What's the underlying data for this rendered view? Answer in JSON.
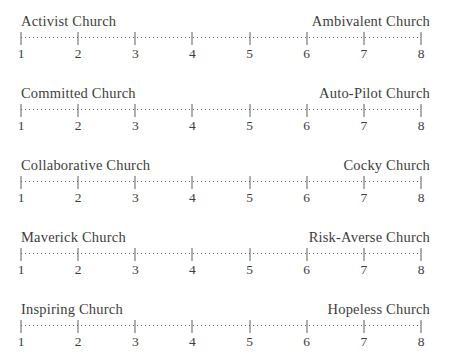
{
  "page": {
    "background_color": "#ffffff",
    "text_color": "#3d3d3d",
    "ruler_color": "#5e5e5e"
  },
  "scales": [
    {
      "left": "Activist Church",
      "right": "Ambivalent Church"
    },
    {
      "left": "Committed Church",
      "right": "Auto-Pilot Church"
    },
    {
      "left": "Collaborative Church",
      "right": "Cocky Church"
    },
    {
      "left": "Maverick Church",
      "right": "Risk-Averse Church"
    },
    {
      "left": "Inspiring Church",
      "right": "Hopeless Church"
    }
  ],
  "tick_labels": [
    "1",
    "2",
    "3",
    "4",
    "5",
    "6",
    "7",
    "8"
  ]
}
